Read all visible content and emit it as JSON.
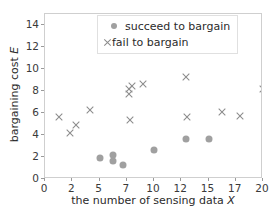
{
  "chart_data": {
    "type": "scatter",
    "title": "",
    "xlabel": "the number of sensing data X",
    "xlabel_plain": "the number of sensing data ",
    "xlabel_italic": "X",
    "ylabel": "bargaining cost E",
    "ylabel_plain": "bargaining cost ",
    "ylabel_italic": "E",
    "xticks": [
      0,
      2,
      5,
      7,
      10,
      12,
      15,
      17,
      20
    ],
    "xtick_labels": [
      "0",
      "2",
      "5",
      "7",
      "10",
      "12",
      "15",
      "17",
      "20"
    ],
    "yticks": [
      0,
      2,
      4,
      6,
      8,
      10,
      12,
      14
    ],
    "ytick_labels": [
      "0",
      "2",
      "4",
      "6",
      "8",
      "10",
      "12",
      "14"
    ],
    "ylim": [
      0,
      15
    ],
    "xlim_index": [
      0,
      8
    ],
    "grid": false,
    "legend_position": "upper center",
    "axis_note": "x tick labels are evenly spaced (ordinal positions), not linear",
    "series": [
      {
        "name": "succeed to bargain",
        "marker": "circle",
        "color": "#a0a0a0",
        "points": [
          {
            "x": 5.0,
            "y": 1.9
          },
          {
            "x": 6.0,
            "y": 2.2
          },
          {
            "x": 6.0,
            "y": 1.6
          },
          {
            "x": 6.7,
            "y": 1.3
          },
          {
            "x": 10.0,
            "y": 2.6
          },
          {
            "x": 12.5,
            "y": 3.6
          },
          {
            "x": 15.0,
            "y": 3.6
          }
        ]
      },
      {
        "name": "fail to bargain",
        "marker": "x",
        "color": "#8c8c8c",
        "points": [
          {
            "x": 1.0,
            "y": 5.6
          },
          {
            "x": 1.8,
            "y": 4.2
          },
          {
            "x": 2.4,
            "y": 4.9
          },
          {
            "x": 4.0,
            "y": 6.3
          },
          {
            "x": 7.3,
            "y": 8.2
          },
          {
            "x": 7.3,
            "y": 7.7
          },
          {
            "x": 7.6,
            "y": 8.5
          },
          {
            "x": 8.8,
            "y": 8.6
          },
          {
            "x": 7.4,
            "y": 5.4
          },
          {
            "x": 12.5,
            "y": 9.3
          },
          {
            "x": 12.6,
            "y": 5.6
          },
          {
            "x": 16.0,
            "y": 6.1
          },
          {
            "x": 17.5,
            "y": 5.7
          },
          {
            "x": 20.0,
            "y": 8.2
          }
        ]
      }
    ],
    "legend": [
      {
        "label": "succeed to bargain",
        "marker": "circle"
      },
      {
        "label": "fail to bargain",
        "marker": "x"
      }
    ]
  }
}
